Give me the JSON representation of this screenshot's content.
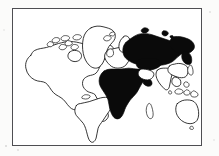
{
  "figure": {
    "kind": "world-map",
    "projection_note": "rectangular world map, outline style",
    "frame": {
      "border_color": "#4e4e52",
      "border_width_px": 1.6,
      "left_px": 12,
      "top_px": 8,
      "width_px": 190,
      "height_px": 138
    },
    "background_color": "#fbfbfa",
    "ocean_color": "#ffffff",
    "outline_color": "#111111",
    "highlight_color": "#0a0a0a",
    "caption": "",
    "title": "",
    "legend": []
  },
  "chart_data": {
    "type": "map",
    "title": "",
    "xlabel": "",
    "ylabel": "",
    "legend_position": "none",
    "grid": false,
    "encoding": {
      "filled": "highlighted region (solid black)",
      "outline": "non-highlighted landmass (white fill, black outline)"
    },
    "regions": [
      {
        "name": "Russia / Soviet Union",
        "style": "filled",
        "value": 1
      },
      {
        "name": "Africa",
        "style": "filled",
        "value": 1
      },
      {
        "name": "North America",
        "style": "outline",
        "value": 0
      },
      {
        "name": "South America",
        "style": "outline",
        "value": 0
      },
      {
        "name": "Greenland",
        "style": "outline",
        "value": 0
      },
      {
        "name": "Europe",
        "style": "outline",
        "value": 0
      },
      {
        "name": "Middle East",
        "style": "outline",
        "value": 0
      },
      {
        "name": "India",
        "style": "outline",
        "value": 0
      },
      {
        "name": "China",
        "style": "outline",
        "value": 0
      },
      {
        "name": "Southeast Asia",
        "style": "outline",
        "value": 0
      },
      {
        "name": "Japan",
        "style": "outline",
        "value": 0
      },
      {
        "name": "Australia",
        "style": "outline",
        "value": 0
      },
      {
        "name": "New Zealand",
        "style": "outline",
        "value": 0
      },
      {
        "name": "Madagascar",
        "style": "outline",
        "value": 0
      },
      {
        "name": "Iceland",
        "style": "outline",
        "value": 0
      },
      {
        "name": "British Isles",
        "style": "outline",
        "value": 0
      },
      {
        "name": "Indonesia",
        "style": "outline",
        "value": 0
      },
      {
        "name": "Canadian Arctic Islands",
        "style": "outline",
        "value": 0
      },
      {
        "name": "Svalbard",
        "style": "filled",
        "value": 1
      },
      {
        "name": "Novaya Zemlya",
        "style": "filled",
        "value": 1
      }
    ],
    "counts": {
      "filled_regions": 4,
      "outline_regions": 16
    }
  }
}
